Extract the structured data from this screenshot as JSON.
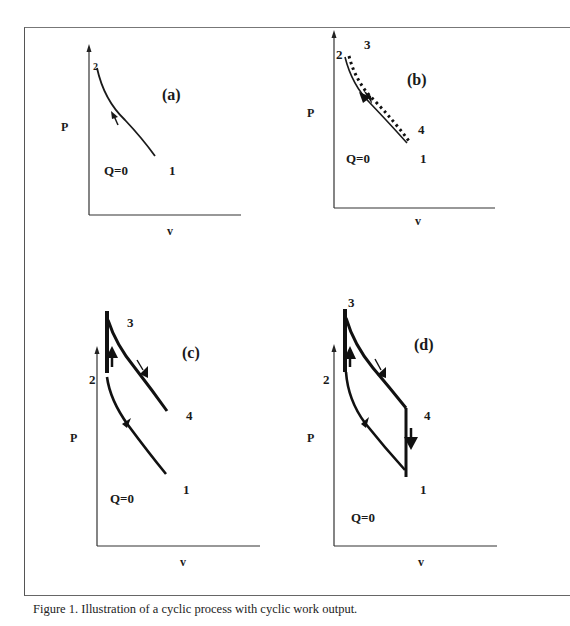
{
  "figure": {
    "caption": "Figure 1. Illustration of a  cyclic process with cyclic work output."
  },
  "panels": [
    {
      "id": "a",
      "title": "(a)",
      "y_axis_label": "P",
      "x_axis_label": "v",
      "annotation": "Q=0",
      "state_labels": {
        "s1": "1",
        "s2": "2"
      },
      "process": "adiabatic compression 1 to 2"
    },
    {
      "id": "b",
      "title": "(b)",
      "y_axis_label": "P",
      "x_axis_label": "v",
      "annotation": "Q=0",
      "state_labels": {
        "s1": "1",
        "s2": "2",
        "s3": "3",
        "s4": "4"
      },
      "process": "compression 1-2 and expansion 3-4 (dotted) overlapping"
    },
    {
      "id": "c",
      "title": "(c)",
      "y_axis_label": "P",
      "x_axis_label": "v",
      "annotation": "Q=0",
      "state_labels": {
        "s1": "1",
        "s2": "2",
        "s3": "3",
        "s4": "4"
      },
      "process": "compression 1-2, constant volume 2-3, expansion 3-4"
    },
    {
      "id": "d",
      "title": "(d)",
      "y_axis_label": "P",
      "x_axis_label": "v",
      "annotation": "Q=0",
      "state_labels": {
        "s1": "1",
        "s2": "2",
        "s3": "3",
        "s4": "4"
      },
      "process": "closed cycle 1-2-3-4-1"
    }
  ]
}
